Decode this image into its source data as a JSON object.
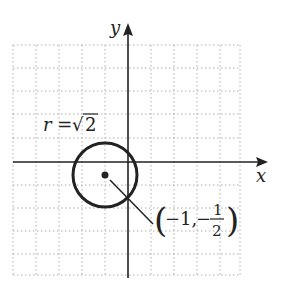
{
  "diagram": {
    "type": "circle-on-grid",
    "axes": {
      "x_label": "x",
      "y_label": "y"
    },
    "grid": {
      "x_min": -5,
      "x_max": 5,
      "y_min": -5,
      "y_max": 5,
      "style": "dotted"
    },
    "circle": {
      "center": [
        -1,
        -0.5
      ],
      "radius_label_prefix": "r = ",
      "radius_label_sqrt": "√",
      "radius_label_value": "2"
    },
    "center_label": {
      "open": "(",
      "x": "−1,",
      "minus": "−",
      "num": "1",
      "den": "2",
      "close": ")"
    }
  },
  "colors": {
    "ink": "#222222",
    "grid": "#9a9a9a"
  }
}
